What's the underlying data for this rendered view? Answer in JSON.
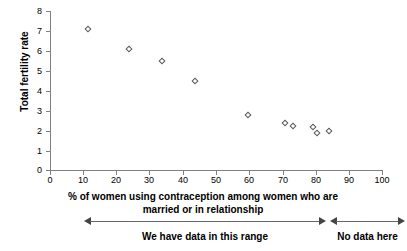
{
  "chart_data": {
    "type": "scatter",
    "title": "",
    "xlabel": "% of women using contraception among women who are married or in relationship",
    "ylabel": "Total fertility rate",
    "xlim": [
      0,
      100
    ],
    "ylim": [
      0,
      8
    ],
    "xticks": [
      0,
      10,
      20,
      30,
      40,
      50,
      60,
      70,
      80,
      90,
      100
    ],
    "yticks": [
      0,
      1,
      2,
      3,
      4,
      5,
      6,
      7,
      8
    ],
    "grid": false,
    "legend": null,
    "marker": "open-diamond",
    "points": [
      {
        "x": 11.5,
        "y": 7.1
      },
      {
        "x": 23.7,
        "y": 6.1
      },
      {
        "x": 33.7,
        "y": 5.5
      },
      {
        "x": 43.7,
        "y": 4.5
      },
      {
        "x": 59.6,
        "y": 2.75
      },
      {
        "x": 70.8,
        "y": 2.35
      },
      {
        "x": 73.2,
        "y": 2.2
      },
      {
        "x": 79.2,
        "y": 2.15
      },
      {
        "x": 80.3,
        "y": 1.85
      },
      {
        "x": 84.0,
        "y": 1.95
      }
    ],
    "annotations": [
      {
        "label": "We have data in this range",
        "x_start": 10,
        "x_end": 83,
        "style": "double-arrow"
      },
      {
        "label": "No data here",
        "x_start": 84,
        "x_end": 100,
        "style": "double-arrow"
      }
    ]
  },
  "axis": {
    "y_labels": [
      "8",
      "7",
      "6",
      "5",
      "4",
      "3",
      "2",
      "1",
      "0"
    ],
    "x_labels": [
      "0",
      "10",
      "20",
      "30",
      "40",
      "50",
      "60",
      "70",
      "80",
      "90",
      "100"
    ],
    "y_title": "Total fertility rate",
    "x_title_line1": "% of women using contraception among women who are",
    "x_title_line2": "married or in relationship"
  },
  "annotations": {
    "range_label": "We have data in this range",
    "nodata_label": "No data here"
  },
  "colors": {
    "axis": "#808080",
    "marker_stroke": "#5a5a5a",
    "text": "#000000",
    "arrow": "#444444",
    "background": "#ffffff"
  }
}
